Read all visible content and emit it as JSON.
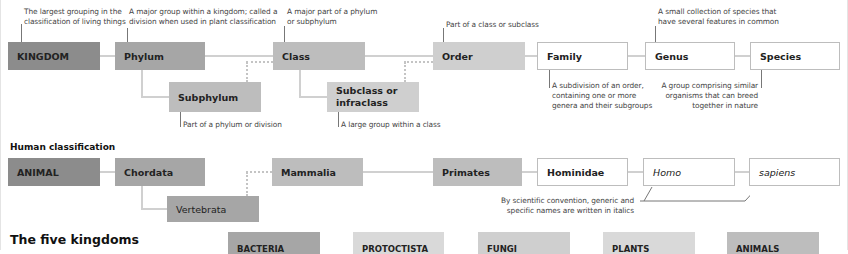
{
  "hierarchy": {
    "ranks": [
      {
        "id": "kingdom",
        "label": "KINGDOM"
      },
      {
        "id": "phylum",
        "label": "Phylum"
      },
      {
        "id": "class",
        "label": "Class"
      },
      {
        "id": "order",
        "label": "Order"
      },
      {
        "id": "family",
        "label": "Family"
      },
      {
        "id": "genus",
        "label": "Genus"
      },
      {
        "id": "species",
        "label": "Species"
      }
    ],
    "subranks": [
      {
        "id": "subphylum",
        "label": "Subphylum"
      },
      {
        "id": "subclass",
        "label": "Subclass or infraclass",
        "line1": "Subclass or",
        "line2": "infraclass"
      }
    ],
    "notes": {
      "kingdom": [
        "The largest grouping in the",
        "classification of living things"
      ],
      "phylum": [
        "A major group within a kingdom; called a",
        "division when used in plant classification"
      ],
      "class": [
        "A major part of a phylum",
        "or subphylum"
      ],
      "order": [
        "Part of a class or subclass"
      ],
      "genus": [
        "A small collection of species that",
        "have several features in common"
      ],
      "subphylum": [
        "Part of a phylum or division"
      ],
      "subclass": [
        "A large group within a class"
      ],
      "family": [
        "A subdivision of an order,",
        "containing one or more",
        "genera and their subgroups"
      ],
      "species": [
        "A group comprising similar",
        "organisms that can breed",
        "together in nature"
      ]
    }
  },
  "human": {
    "heading": "Human classification",
    "ranks": [
      {
        "id": "animal",
        "label": "ANIMAL"
      },
      {
        "id": "chordata",
        "label": "Chordata"
      },
      {
        "id": "mammalia",
        "label": "Mammalia"
      },
      {
        "id": "primates",
        "label": "Primates"
      },
      {
        "id": "hominidae",
        "label": "Hominidae"
      },
      {
        "id": "homo",
        "label": "Homo"
      },
      {
        "id": "sapiens",
        "label": "sapiens"
      }
    ],
    "sub": {
      "id": "vertebrata",
      "label": "Vertebrata"
    },
    "note": [
      "By scientific convention, generic and",
      "specific names are written in italics"
    ]
  },
  "five_kingdoms": {
    "heading": "The five kingdoms",
    "items": [
      {
        "label": "BACTERIA"
      },
      {
        "label": "PROTOCTISTA"
      },
      {
        "label": "FUNGI"
      },
      {
        "label": "PLANTS"
      },
      {
        "label": "ANIMALS"
      }
    ]
  },
  "colors": {
    "rank1": "#8c8c8c",
    "rank2": "#a6a6a6",
    "rank3": "#bdbdbd",
    "rank4": "#cfcfcf",
    "rank5": "#d9d9d9",
    "white_box_border": "#bdbdbd",
    "connector": "#d0d0d0"
  }
}
